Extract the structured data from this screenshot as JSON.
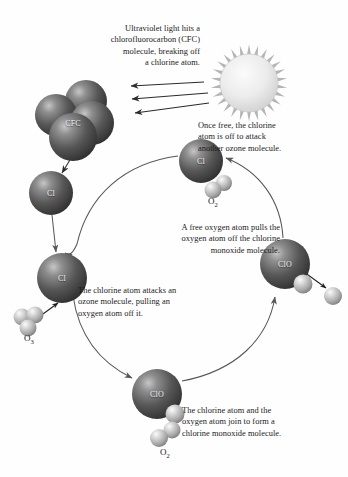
{
  "diagram": {
    "captions": [
      {
        "id": "uv-hits-cfc",
        "text": "Ultraviolet light hits a\nchlorofluorocarbon (CFC)\nmolecule, breaking off\na chlorine atom.",
        "align": "right"
      },
      {
        "id": "once-free",
        "text": "Once free, the chlorine\natom is off to attack\nanother ozone molecule.",
        "align": "left"
      },
      {
        "id": "free-oxygen-pulls",
        "text": "A free oxygen atom pulls the\noxygen atom off the chlorine\nmonoxide molecule.",
        "align": "right"
      },
      {
        "id": "chlorine-attacks-ozone",
        "text": "The chlorine atom attacks an\nozone molecule, pulling an\noxygen atom off it.",
        "align": "left"
      },
      {
        "id": "join-to-form-clo",
        "text": "The chlorine atom and the\noxygen atom join to form a\nchlorine monoxide molecule.",
        "align": "left"
      }
    ],
    "molecules": [
      {
        "id": "cfc-cluster",
        "label": "CFC",
        "kind": "dark-cluster"
      },
      {
        "id": "cl-upper-left",
        "label": "Cl",
        "kind": "dark-sphere"
      },
      {
        "id": "cl-lower-left",
        "label": "Cl",
        "kind": "dark-sphere"
      },
      {
        "id": "cl-top",
        "label": "Cl",
        "kind": "dark-sphere"
      },
      {
        "id": "clo-right",
        "label": "ClO",
        "kind": "dark-sphere"
      },
      {
        "id": "clo-bottom",
        "label": "ClO",
        "kind": "dark-sphere"
      }
    ],
    "formulas": [
      {
        "id": "o2-top",
        "symbol": "O",
        "subscript": "2"
      },
      {
        "id": "o3-left",
        "symbol": "O",
        "subscript": "3"
      },
      {
        "id": "o2-bottom",
        "symbol": "O",
        "subscript": "2"
      }
    ],
    "sun": {
      "id": "sun",
      "ray_count": 26,
      "beam_count": 3
    },
    "colors": {
      "background": "#ffffff",
      "text": "#1b1b1b",
      "sphere_dark": "#4a4a4a",
      "sphere_light": "#c9c9c9",
      "arrow": "#2a2a2a",
      "cycle_arrow": "#545454",
      "sun_disc": "#e8e8e8",
      "sun_ray": "#b5b5b5"
    }
  }
}
